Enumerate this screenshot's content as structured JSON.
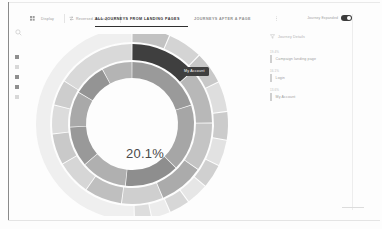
{
  "app": {
    "title": "Journey Analytics"
  },
  "rail": {
    "items": [
      {
        "name": "search",
        "icon": "search-icon",
        "label": "Search"
      },
      {
        "name": "grid",
        "icon": "grid-icon",
        "label": "Dashboards"
      },
      {
        "name": "funnel",
        "icon": "funnel-icon",
        "label": "Funnels"
      },
      {
        "name": "journeys",
        "icon": "journey-icon",
        "label": "Journeys"
      },
      {
        "name": "segments",
        "icon": "segment-icon",
        "label": "Segments"
      },
      {
        "name": "settings",
        "icon": "gear-icon",
        "label": "Settings"
      }
    ]
  },
  "toolbar": {
    "grid_icon": "grid-icon",
    "display_label": "Display",
    "reverse_icon": "reverse-icon",
    "reverse_label": "Reversed Journey",
    "reverse_caret": "chevron-down-icon",
    "more_icon": "more-icon",
    "tabs": [
      {
        "label": "ALL JOURNEYS FROM LANDING PAGES",
        "active": true
      },
      {
        "label": "JOURNEYS AFTER A PAGE",
        "active": false
      }
    ],
    "toggle": {
      "label": "Journey Expanded",
      "on": true
    }
  },
  "chart_data": {
    "type": "pie",
    "title": "All journeys from landing pages",
    "center_value": "20.1%",
    "highlight_label": "My Account",
    "highlight_color": "#3f3f3f",
    "rings": [
      {
        "level": 1,
        "inner_radius": 46,
        "outer_radius": 62,
        "segments": [
          {
            "label": "Home",
            "value": 20.1,
            "color": "#9a9a9a"
          },
          {
            "label": "Catalog",
            "value": 17.4,
            "color": "#a6a6a6"
          },
          {
            "label": "My Account",
            "value": 14.2,
            "color": "#8e8e8e"
          },
          {
            "label": "Login",
            "value": 12.0,
            "color": "#b0b0b0"
          },
          {
            "label": "Search",
            "value": 10.5,
            "color": "#999999"
          },
          {
            "label": "Cart",
            "value": 9.3,
            "color": "#a9a9a9"
          },
          {
            "label": "Support",
            "value": 8.6,
            "color": "#949494"
          },
          {
            "label": "Other",
            "value": 7.9,
            "color": "#b4b4b4"
          }
        ]
      },
      {
        "level": 2,
        "inner_radius": 64,
        "outer_radius": 80,
        "segments": [
          {
            "label": "My Account",
            "value": 13.6,
            "color": "#3f3f3f"
          },
          {
            "label": "Product Detail",
            "value": 11.2,
            "color": "#b8b8b8"
          },
          {
            "label": "Checkout",
            "value": 9.8,
            "color": "#c4c4c4"
          },
          {
            "label": "Category",
            "value": 9.1,
            "color": "#ababab"
          },
          {
            "label": "Login",
            "value": 8.4,
            "color": "#cfcfcf"
          },
          {
            "label": "Wishlist",
            "value": 7.6,
            "color": "#bfbfbf"
          },
          {
            "label": "Orders",
            "value": 7.0,
            "color": "#d6d6d6"
          },
          {
            "label": "Profile",
            "value": 6.3,
            "color": "#c9c9c9"
          },
          {
            "label": "Help",
            "value": 5.8,
            "color": "#dcdcdc"
          },
          {
            "label": "Exit",
            "value": 5.2,
            "color": "#cdcdcd"
          },
          {
            "label": "Other",
            "value": 16.0,
            "color": "#d9d9d9"
          }
        ]
      },
      {
        "level": 3,
        "inner_radius": 82,
        "outer_radius": 96,
        "segments": [
          {
            "label": "Settings",
            "value": 6.4,
            "color": "#c2c2c2"
          },
          {
            "label": "Payment",
            "value": 5.9,
            "color": "#d4d4d4"
          },
          {
            "label": "Address",
            "value": 5.5,
            "color": "#c8c8c8"
          },
          {
            "label": "Returns",
            "value": 5.1,
            "color": "#dedede"
          },
          {
            "label": "Reviews",
            "value": 4.8,
            "color": "#cbcbcb"
          },
          {
            "label": "Compare",
            "value": 4.4,
            "color": "#e2e2e2"
          },
          {
            "label": "Coupons",
            "value": 4.1,
            "color": "#d0d0d0"
          },
          {
            "label": "Track",
            "value": 3.8,
            "color": "#e6e6e6"
          },
          {
            "label": "Contact",
            "value": 3.5,
            "color": "#d7d7d7"
          },
          {
            "label": "FAQ",
            "value": 3.2,
            "color": "#ececec"
          },
          {
            "label": "Blog",
            "value": 2.9,
            "color": "#dddddd"
          },
          {
            "label": "Exit",
            "value": 50.4,
            "color": "#efefef"
          }
        ]
      }
    ]
  },
  "panel": {
    "header": {
      "icon": "filter-icon",
      "label": "Journey Details"
    },
    "rows": [
      {
        "pct": "19.4%",
        "label": "Campaign landing page",
        "bar_color": "#d2d2d2"
      },
      {
        "pct": "16.1%",
        "label": "Login",
        "bar_color": "#a8a8a8"
      },
      {
        "pct": "13.6%",
        "label": "My Account",
        "bar_color": "#4a4a4a"
      }
    ]
  }
}
